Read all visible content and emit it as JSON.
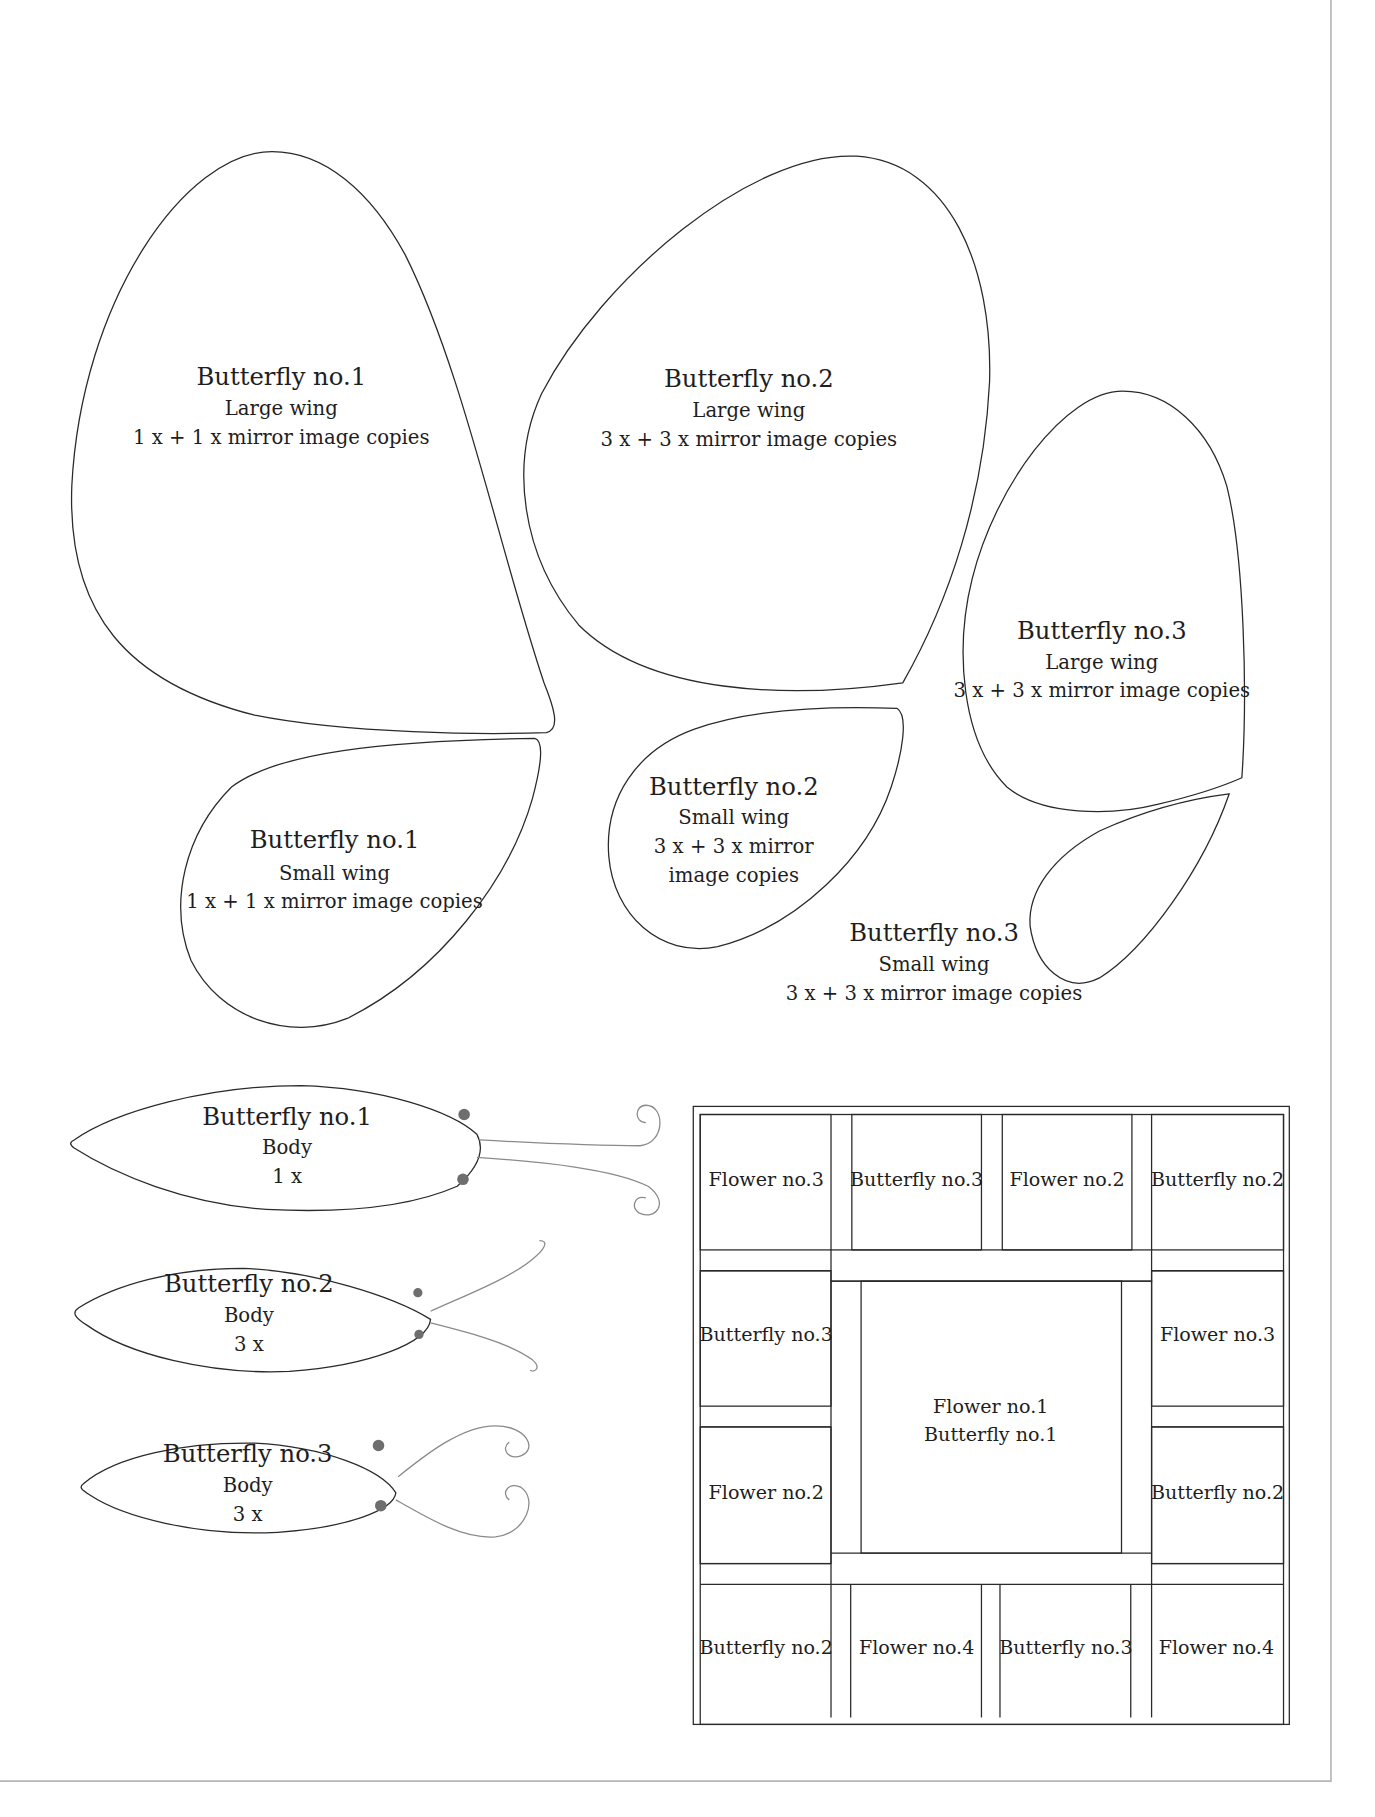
{
  "document": {
    "type": "quilt-pattern-templates",
    "colors": {
      "outline": "#2a2a2a",
      "antenna": "#8a8a8a",
      "antenna_dot": "#6e6e6e",
      "page_border": "#b5b5b5",
      "background": "#ffffff"
    }
  },
  "wings": [
    {
      "id": "b1-large",
      "title": "Butterfly no.1",
      "part": "Large wing",
      "copies": "1 x + 1 x mirror image copies"
    },
    {
      "id": "b2-large",
      "title": "Butterfly no.2",
      "part": "Large wing",
      "copies": "3 x + 3 x mirror image copies"
    },
    {
      "id": "b3-large",
      "title": "Butterfly no.3",
      "part": "Large wing",
      "copies": "3 x + 3 x mirror image copies"
    },
    {
      "id": "b1-small",
      "title": "Butterfly no.1",
      "part": "Small wing",
      "copies": "1 x + 1 x mirror image copies"
    },
    {
      "id": "b2-small",
      "title": "Butterfly no.2",
      "part": "Small wing",
      "copies_line1": "3 x + 3 x mirror",
      "copies_line2": "image copies"
    },
    {
      "id": "b3-small",
      "title": "Butterfly no.3",
      "part": "Small wing",
      "copies": "3 x + 3 x mirror image copies"
    }
  ],
  "bodies": [
    {
      "id": "b1-body",
      "title": "Butterfly no.1",
      "part": "Body",
      "copies": "1 x"
    },
    {
      "id": "b2-body",
      "title": "Butterfly no.2",
      "part": "Body",
      "copies": "3 x"
    },
    {
      "id": "b3-body",
      "title": "Butterfly no.3",
      "part": "Body",
      "copies": "3 x"
    }
  ],
  "quilt_layout": {
    "top_row": [
      "Flower no.3",
      "Butterfly no.3",
      "Flower no.2",
      "Butterfly no.2"
    ],
    "left_column": [
      "Butterfly no.3",
      "Flower no.2"
    ],
    "right_column": [
      "Flower no.3",
      "Butterfly no.2"
    ],
    "bottom_row": [
      "Butterfly no.2",
      "Flower no.4",
      "Butterfly no.3",
      "Flower no.4"
    ],
    "center": [
      "Flower no.1",
      "Butterfly no.1"
    ]
  }
}
